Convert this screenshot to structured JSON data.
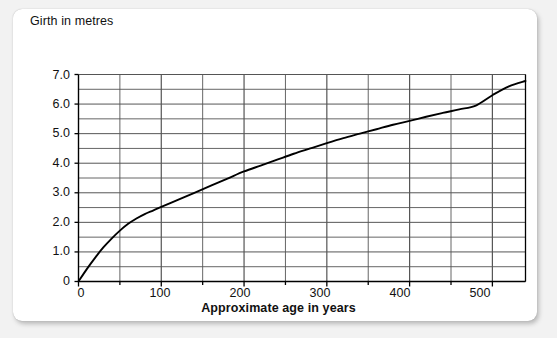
{
  "chart_data": {
    "type": "line",
    "title": "",
    "xlabel": "Approximate age in years",
    "ylabel": "Girth in metres",
    "xlim": [
      0,
      540
    ],
    "ylim": [
      0,
      7.3
    ],
    "grid": true,
    "legend": null,
    "x_major_step": 100,
    "x_minor_step": 50,
    "y_major_step": 1.0,
    "y_minor_step": 0.5,
    "x_tick_labels": [
      "0",
      "100",
      "200",
      "300",
      "400",
      "500"
    ],
    "x_tick_values": [
      0,
      100,
      200,
      300,
      400,
      500
    ],
    "y_tick_labels": [
      "0",
      "1.0",
      "2.0",
      "3.0",
      "4.0",
      "5.0",
      "6.0",
      "7.0"
    ],
    "y_tick_values": [
      0,
      1.0,
      2.0,
      3.0,
      4.0,
      5.0,
      6.0,
      7.0
    ],
    "series": [
      {
        "name": "Girth",
        "color": "#000000",
        "x": [
          0,
          10,
          20,
          30,
          40,
          50,
          60,
          70,
          80,
          90,
          100,
          120,
          140,
          160,
          180,
          200,
          220,
          240,
          260,
          280,
          300,
          320,
          340,
          360,
          380,
          400,
          420,
          440,
          460,
          480,
          500,
          520,
          540
        ],
        "values": [
          0,
          0.42,
          0.8,
          1.15,
          1.45,
          1.72,
          1.95,
          2.13,
          2.28,
          2.4,
          2.52,
          2.76,
          3.0,
          3.24,
          3.48,
          3.72,
          3.92,
          4.12,
          4.32,
          4.5,
          4.68,
          4.85,
          5.0,
          5.15,
          5.3,
          5.43,
          5.57,
          5.7,
          5.82,
          5.95,
          6.3,
          6.6,
          6.78
        ]
      }
    ],
    "annotations": [],
    "notes": {
      "axis_color": "#000000",
      "grid_color": "#555555",
      "plot_background": "#ffffff"
    }
  },
  "page": {
    "background": "#f2f2f2",
    "card_background": "#ffffff"
  }
}
